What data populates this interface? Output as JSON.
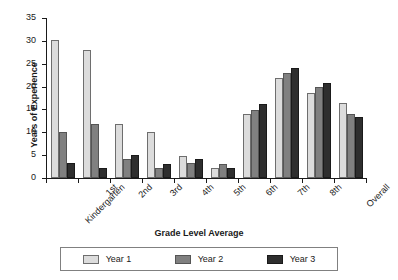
{
  "chart_data": {
    "type": "bar",
    "title": "",
    "xlabel": "Grade Level Average",
    "ylabel": "Years of Experience",
    "categories": [
      "Kindergarten",
      "1st",
      "2nd",
      "3rd",
      "4th",
      "5th",
      "6th",
      "7th",
      "8th",
      "Overall"
    ],
    "series": [
      {
        "name": "Year 1",
        "color": "#dcdcdc",
        "values": [
          30.1,
          28.0,
          11.8,
          10.0,
          4.9,
          2.2,
          14.0,
          21.8,
          18.7,
          16.4
        ]
      },
      {
        "name": "Year 2",
        "color": "#808080",
        "values": [
          10.1,
          11.9,
          4.1,
          2.3,
          3.2,
          3.1,
          14.8,
          23.0,
          19.9,
          13.9
        ]
      },
      {
        "name": "Year 3",
        "color": "#2e2e2e",
        "values": [
          3.2,
          2.3,
          5.0,
          3.1,
          4.1,
          2.1,
          16.2,
          24.0,
          20.8,
          13.4
        ]
      }
    ],
    "ylim": [
      0,
      35
    ],
    "yticks": [
      0,
      5,
      10,
      15,
      20,
      25,
      30,
      35
    ],
    "ytick_labels": [
      "0",
      "5",
      "10",
      "15",
      "20",
      "25",
      "30",
      "35"
    ],
    "grid": false,
    "legend_position": "bottom",
    "xtick_label_rotation": -45
  },
  "legend": {
    "items": [
      {
        "label": "Year 1",
        "swatch": "legend-swatch-year-1"
      },
      {
        "label": "Year 2",
        "swatch": "legend-swatch-year-2"
      },
      {
        "label": "Year 3",
        "swatch": "legend-swatch-year-3"
      }
    ]
  }
}
